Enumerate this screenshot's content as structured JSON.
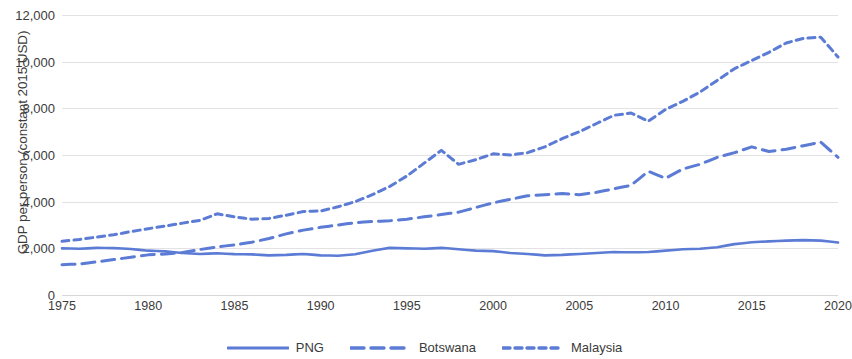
{
  "chart_data": {
    "type": "line",
    "title": "",
    "xlabel": "",
    "ylabel": "GDP per person (constant 2015 USD)",
    "xlim": [
      1975,
      2020
    ],
    "ylim": [
      0,
      12000
    ],
    "grid": true,
    "legend_position": "bottom",
    "y_ticks": [
      "0",
      "2,000",
      "4,000",
      "6,000",
      "8,000",
      "10,000",
      "12,000"
    ],
    "y_tick_values": [
      0,
      2000,
      4000,
      6000,
      8000,
      10000,
      12000
    ],
    "x_ticks": [
      "1975",
      "1980",
      "1985",
      "1990",
      "1995",
      "2000",
      "2005",
      "2010",
      "2015",
      "2020"
    ],
    "x_tick_values": [
      1975,
      1980,
      1985,
      1990,
      1995,
      2000,
      2005,
      2010,
      2015,
      2020
    ],
    "x": [
      1975,
      1976,
      1977,
      1978,
      1979,
      1980,
      1981,
      1982,
      1983,
      1984,
      1985,
      1986,
      1987,
      1988,
      1989,
      1990,
      1991,
      1992,
      1993,
      1994,
      1995,
      1996,
      1997,
      1998,
      1999,
      2000,
      2001,
      2002,
      2003,
      2004,
      2005,
      2006,
      2007,
      2008,
      2009,
      2010,
      2011,
      2012,
      2013,
      2014,
      2015,
      2016,
      2017,
      2018,
      2019,
      2020
    ],
    "series": [
      {
        "name": "PNG",
        "style": "solid",
        "color": "#5B7BD5",
        "values": [
          2000,
          1980,
          2020,
          2010,
          1970,
          1900,
          1870,
          1800,
          1760,
          1790,
          1750,
          1740,
          1700,
          1720,
          1760,
          1700,
          1680,
          1750,
          1900,
          2020,
          2000,
          1980,
          2020,
          1960,
          1900,
          1880,
          1800,
          1760,
          1700,
          1720,
          1760,
          1800,
          1840,
          1830,
          1840,
          1900,
          1960,
          1980,
          2050,
          2180,
          2260,
          2300,
          2330,
          2350,
          2330,
          2250
        ]
      },
      {
        "name": "Botswana",
        "style": "dashed-long",
        "color": "#5B7BD5",
        "values": [
          1300,
          1330,
          1420,
          1520,
          1620,
          1720,
          1760,
          1820,
          1950,
          2060,
          2150,
          2260,
          2420,
          2620,
          2780,
          2900,
          3000,
          3100,
          3150,
          3180,
          3250,
          3350,
          3450,
          3550,
          3750,
          3950,
          4100,
          4250,
          4300,
          4350,
          4300,
          4400,
          4550,
          4700,
          5300,
          5000,
          5400,
          5600,
          5900,
          6100,
          6350,
          6150,
          6250,
          6400,
          6550,
          5900
        ]
      },
      {
        "name": "Malaysia",
        "style": "dashed-short",
        "color": "#5B7BD5",
        "values": [
          2300,
          2380,
          2480,
          2580,
          2720,
          2840,
          2960,
          3080,
          3200,
          3480,
          3350,
          3250,
          3280,
          3420,
          3580,
          3600,
          3780,
          4000,
          4300,
          4650,
          5100,
          5650,
          6200,
          5600,
          5800,
          6050,
          6000,
          6100,
          6350,
          6700,
          7000,
          7350,
          7700,
          7800,
          7450,
          7950,
          8300,
          8700,
          9200,
          9700,
          10050,
          10400,
          10800,
          11000,
          11050,
          10200
        ]
      }
    ]
  },
  "legend": {
    "items": [
      {
        "label": "PNG",
        "style": "solid"
      },
      {
        "label": "Botswana",
        "style": "dashed-long"
      },
      {
        "label": "Malaysia",
        "style": "dashed-short"
      }
    ]
  },
  "colors": {
    "series": "#5B7BD5",
    "grid": "#e2e2e4",
    "text": "#3b3b3b",
    "background": "#ffffff"
  }
}
